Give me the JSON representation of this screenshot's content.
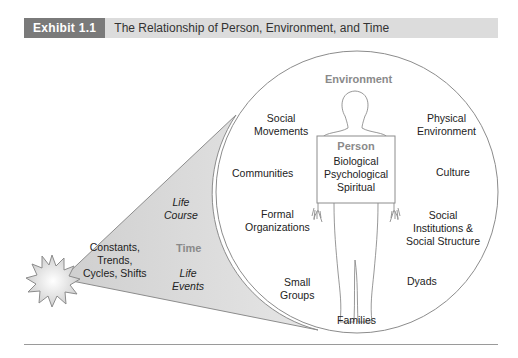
{
  "header": {
    "exhibit_label": "Exhibit 1.1",
    "title": "The Relationship of Person, Environment, and Time"
  },
  "colors": {
    "exhibit_tag_bg": "#7a7a7a",
    "header_bar_bg": "#dcdcdc",
    "cone_fill": "#d9d9d9",
    "outline": "#8c8c8c",
    "gray_heading": "#8a8a8a"
  },
  "environment": {
    "heading": "Environment",
    "items": {
      "social_movements": [
        "Social",
        "Movements"
      ],
      "communities": "Communities",
      "formal_organizations": [
        "Formal",
        "Organizations"
      ],
      "small_groups": [
        "Small",
        "Groups"
      ],
      "families": "Families",
      "dyads": "Dyads",
      "social_institutions": [
        "Social",
        "Institutions &",
        "Social Structure"
      ],
      "culture": "Culture",
      "physical_environment": [
        "Physical",
        "Environment"
      ]
    }
  },
  "person": {
    "heading": "Person",
    "dimensions": [
      "Biological",
      "Psychological",
      "Spiritual"
    ]
  },
  "time": {
    "heading": "Time",
    "life_course": [
      "Life",
      "Course"
    ],
    "life_events": [
      "Life",
      "Events"
    ],
    "patterns": [
      "Constants,",
      "Trends,",
      "Cycles, Shifts"
    ]
  }
}
